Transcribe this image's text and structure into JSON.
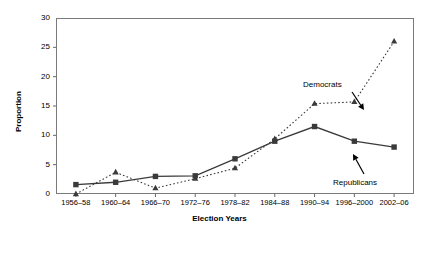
{
  "chart_data": {
    "type": "line",
    "title": "",
    "xlabel": "Election Years",
    "ylabel": "Proportion",
    "categories": [
      "1956–58",
      "1960–64",
      "1966–70",
      "1972–76",
      "1978–82",
      "1984–88",
      "1990–94",
      "1996–2000",
      "2002–06"
    ],
    "ylim": [
      0,
      30
    ],
    "yticks": [
      0,
      5,
      10,
      15,
      20,
      25,
      30
    ],
    "grid": false,
    "legend": "annotations-inline",
    "series": [
      {
        "name": "Republicans",
        "marker": "square",
        "line_style": "solid",
        "color": "#3a3a3a",
        "values": [
          1.6,
          2.0,
          3.0,
          3.1,
          6.0,
          9.0,
          11.5,
          9.0,
          8.0
        ]
      },
      {
        "name": "Democrats",
        "marker": "triangle",
        "line_style": "dotted",
        "color": "#3a3a3a",
        "values": [
          0.0,
          3.7,
          1.0,
          2.6,
          4.4,
          9.4,
          15.4,
          15.7,
          26.0
        ]
      }
    ],
    "annotations": [
      {
        "text": "Democrats",
        "series": "Democrats",
        "points_to_category": "1996–2000"
      },
      {
        "text": "Republicans",
        "series": "Republicans",
        "points_to_category": "1996–2000"
      }
    ]
  }
}
